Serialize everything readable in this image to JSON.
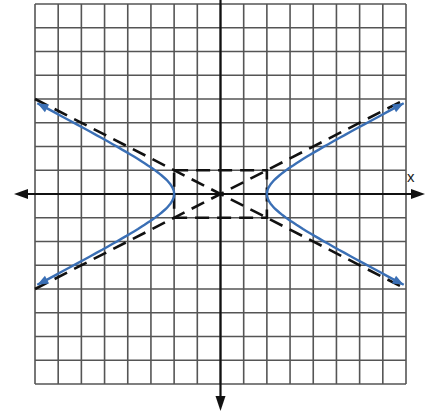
{
  "chart_data": {
    "type": "line",
    "title": "",
    "xlabel": "x",
    "ylabel": "",
    "xlim": [
      -8,
      8
    ],
    "ylim": [
      -8,
      8
    ],
    "grid": true,
    "grid_step": 1,
    "series": [
      {
        "name": "hyperbola",
        "equation": "x^2/4 - y^2/1 = 1",
        "style": "solid",
        "color": "#3a6fb5",
        "vertices": [
          [
            -2,
            0
          ],
          [
            2,
            0
          ]
        ],
        "branches": [
          {
            "side": "left",
            "x": [
              -7.9,
              -6,
              -4,
              -3,
              -2.5,
              -2,
              -2.5,
              -3,
              -4,
              -6,
              -7.9
            ],
            "y": [
              3.82,
              2.83,
              1.73,
              1.12,
              0.75,
              0,
              -0.75,
              -1.12,
              -1.73,
              -2.83,
              -3.82
            ]
          },
          {
            "side": "right",
            "x": [
              7.9,
              6,
              4,
              3,
              2.5,
              2,
              2.5,
              3,
              4,
              6,
              7.9
            ],
            "y": [
              3.82,
              2.83,
              1.73,
              1.12,
              0.75,
              0,
              -0.75,
              -1.12,
              -1.73,
              -2.83,
              -3.82
            ]
          }
        ]
      },
      {
        "name": "asymptote-1",
        "equation": "y = x/2",
        "style": "dashed",
        "color": "#111111",
        "x": [
          -8,
          8
        ],
        "y": [
          -4,
          4
        ]
      },
      {
        "name": "asymptote-2",
        "equation": "y = -x/2",
        "style": "dashed",
        "color": "#111111",
        "x": [
          -8,
          8
        ],
        "y": [
          4,
          -4
        ]
      },
      {
        "name": "central-rectangle",
        "style": "dashed",
        "color": "#111111",
        "corners": [
          [
            -2,
            1
          ],
          [
            2,
            1
          ],
          [
            2,
            -1
          ],
          [
            -2,
            -1
          ]
        ]
      }
    ]
  },
  "labels": {
    "x_axis": "x"
  },
  "colors": {
    "grid": "#555555",
    "axis": "#111111",
    "curve": "#3a6fb5",
    "dashed": "#111111"
  }
}
